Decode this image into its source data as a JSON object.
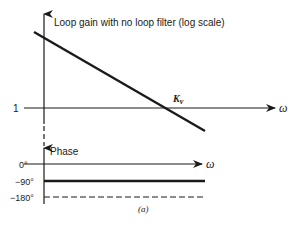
{
  "gain_plot": {
    "title": "Loop gain with no loop filter (log scale)",
    "y_tick": "1",
    "x_axis_label": "ω",
    "crossover_label": "K",
    "crossover_subscript": "v"
  },
  "phase_plot": {
    "title": "Phase",
    "x_axis_label": "ω",
    "ticks": [
      "0°",
      "−90°",
      "−180°"
    ]
  },
  "caption": "(a)",
  "colors": {
    "ink": "#1a1a1a",
    "background": "#ffffff"
  }
}
